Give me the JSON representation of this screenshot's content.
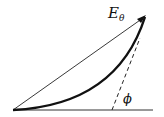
{
  "diagram": {
    "labels": {
      "field_symbol": "E",
      "field_subscript": "θ",
      "angle": "ϕ"
    },
    "elements": [
      {
        "type": "baseline",
        "description": "horizontal reference line"
      },
      {
        "type": "arrow",
        "description": "straight chord vector E_theta from origin to tip"
      },
      {
        "type": "curve",
        "description": "thick curved trajectory from origin to tip"
      },
      {
        "type": "dashed-line",
        "description": "tangent line at tip meeting baseline at angle phi"
      }
    ],
    "colors": {
      "stroke": "#111111",
      "background": "#ffffff"
    }
  }
}
